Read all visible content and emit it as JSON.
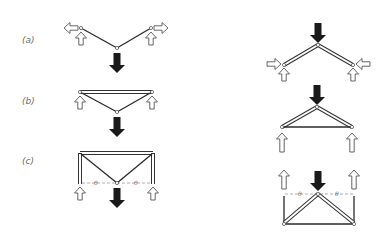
{
  "figure": {
    "left_column": [
      {
        "id": "a",
        "label": "(a)",
        "theta": []
      },
      {
        "id": "b",
        "label": "(b)",
        "theta": []
      },
      {
        "id": "c",
        "label": "(c)",
        "theta": [
          "θ",
          "θ"
        ]
      }
    ],
    "right_column": [
      {
        "id": "a-inverted",
        "theta": []
      },
      {
        "id": "b-inverted",
        "theta": []
      },
      {
        "id": "c-inverted",
        "theta": [
          "θ",
          "θ"
        ]
      }
    ]
  },
  "colors": {
    "member": "#2a2a2a",
    "load_arrow": "#1a1a1a",
    "reaction_arrow_outline": "#555555",
    "label": "#6a6a6a",
    "dashed": "#999999"
  }
}
